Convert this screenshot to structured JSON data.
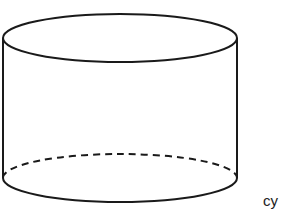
{
  "diagram": {
    "shape": "cylinder",
    "caption": "cy",
    "stroke_color": "#1a1a1a",
    "background": "#ffffff",
    "top_ellipse": {
      "cx": 120,
      "cy": 38,
      "rx": 117,
      "ry": 24
    },
    "bottom_ellipse": {
      "cx": 120,
      "cy": 178,
      "rx": 117,
      "ry": 24
    },
    "hidden_edge_style": "dashed"
  }
}
